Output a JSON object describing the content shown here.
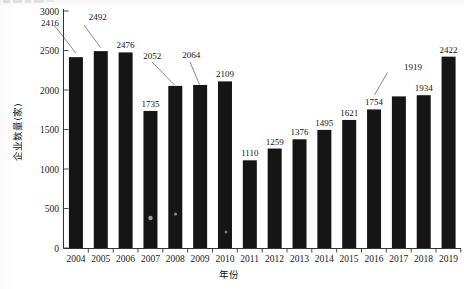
{
  "figure": {
    "name": "enterprise-count-by-year-bar-chart",
    "background_color": "#ffffff",
    "bar_color": "#151515",
    "axis_color": "#333333"
  },
  "axes": {
    "y_title": "企业数量(家)",
    "x_title": "年份",
    "y_ticks": [
      "0",
      "500",
      "1000",
      "1500",
      "2000",
      "2500",
      "3000"
    ],
    "y_min": 0,
    "y_max": 3000,
    "y_tick_step": 500,
    "x_ticks": [
      "2004",
      "2005",
      "2006",
      "2007",
      "2008",
      "2009",
      "2010",
      "2011",
      "2012",
      "2013",
      "2014",
      "2015",
      "2016",
      "2017",
      "2018",
      "2019"
    ]
  },
  "chart_data": {
    "type": "bar",
    "title": "",
    "xlabel": "年份",
    "ylabel": "企业数量(家)",
    "ylim": [
      0,
      3000
    ],
    "grid": false,
    "legend": false,
    "categories": [
      "2004",
      "2005",
      "2006",
      "2007",
      "2008",
      "2009",
      "2010",
      "2011",
      "2012",
      "2013",
      "2014",
      "2015",
      "2016",
      "2017",
      "2018",
      "2019"
    ],
    "values": [
      2416,
      2492,
      2476,
      1735,
      2052,
      2064,
      2109,
      1110,
      1259,
      1376,
      1495,
      1621,
      1754,
      1919,
      1934,
      2422
    ],
    "data_labels": [
      "2416",
      "2492",
      "2476",
      "1735",
      "2052",
      "2064",
      "2109",
      "1110",
      "1259",
      "1376",
      "1495",
      "1621",
      "1754",
      "1919",
      "1934",
      "2422"
    ],
    "labels_with_leader_lines": [
      "2416",
      "2492",
      "2052",
      "2064",
      "1919"
    ],
    "series": [
      {
        "name": "企业数量",
        "values": [
          2416,
          2492,
          2476,
          1735,
          2052,
          2064,
          2109,
          1110,
          1259,
          1376,
          1495,
          1621,
          1754,
          1919,
          1934,
          2422
        ]
      }
    ]
  }
}
